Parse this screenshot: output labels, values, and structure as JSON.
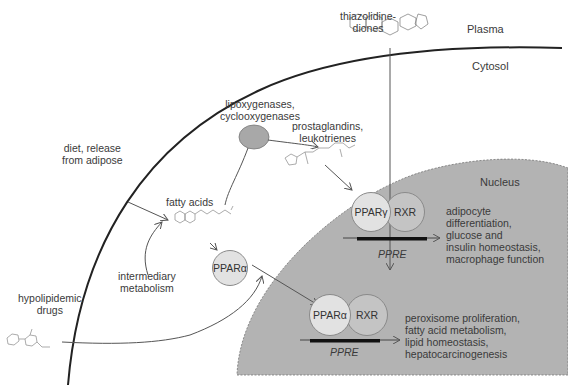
{
  "compartments": {
    "plasma": "Plasma",
    "cytosol": "Cytosol",
    "nucleus": "Nucleus"
  },
  "ligands": {
    "thiazolidinediones": [
      "thiazolidine-",
      "diones"
    ],
    "lipoxygenases": [
      "lipoxygenases,",
      "cyclooxygenases"
    ],
    "prostaglandins": [
      "prostaglandins,",
      "leukotrienes"
    ],
    "diet": [
      "diet, release",
      "from adipose"
    ],
    "fatty_acids": "fatty acids",
    "intermediary": [
      "intermediary",
      "metabolism"
    ],
    "hypolipidemic": [
      "hypolipidemic",
      "drugs"
    ]
  },
  "receptors": {
    "ppar_alpha_free": "PPARα",
    "ppar_gamma": "PPARγ",
    "rxr_top": "RXR",
    "ppar_alpha_bound": "PPARα",
    "rxr_bottom": "RXR",
    "ppre_top": "PPRE",
    "ppre_bottom": "PPRE"
  },
  "outcomes": {
    "gamma": [
      "adipocyte",
      "differentiation,",
      "glucose and",
      "insulin homeostasis,",
      "macrophage function"
    ],
    "alpha": [
      "peroxisome proliferation,",
      "fatty acid metabolism,",
      "lipid homeostasis,",
      "hepatocarcinogenesis"
    ]
  },
  "colors": {
    "nucleus_fill": "#b3b3b3",
    "ppar_fill": "#e2e2e2",
    "rxr_fill": "#c4c4c4",
    "enzyme_fill": "#a8a8a8",
    "ppre_bar": "#111111"
  }
}
